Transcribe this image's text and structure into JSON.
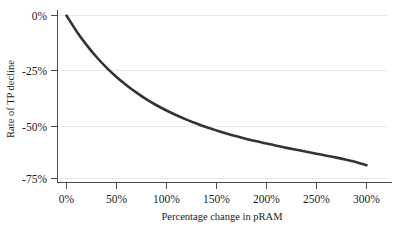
{
  "chart_data": {
    "type": "line",
    "title": "",
    "xlabel": "Percentage change in pRAM",
    "ylabel": "Rate of TP decline",
    "xlim": [
      0,
      300
    ],
    "ylim": [
      -75,
      0
    ],
    "grid": true,
    "legend": null,
    "x_tick_labels": [
      "0%",
      "50%",
      "100%",
      "150%",
      "200%",
      "250%",
      "300%"
    ],
    "x_ticks": [
      0,
      50,
      100,
      150,
      200,
      250,
      300
    ],
    "y_tick_labels": [
      "0%",
      "-25%",
      "-50%",
      "-75%"
    ],
    "y_ticks": [
      0,
      -25,
      -50,
      -75
    ],
    "series": [
      {
        "name": "Rate of TP decline",
        "color": "#333333",
        "x": [
          0,
          10,
          20,
          30,
          40,
          50,
          60,
          70,
          80,
          90,
          100,
          110,
          120,
          130,
          140,
          150,
          160,
          170,
          180,
          190,
          200,
          210,
          220,
          230,
          240,
          250,
          260,
          270,
          280,
          290,
          300
        ],
        "values": [
          0,
          -7.2,
          -13.5,
          -19.1,
          -24.0,
          -28.3,
          -32.1,
          -35.5,
          -38.6,
          -41.3,
          -43.7,
          -45.9,
          -47.9,
          -49.7,
          -51.4,
          -52.9,
          -54.3,
          -55.6,
          -56.8,
          -57.9,
          -58.9,
          -59.9,
          -60.9,
          -61.8,
          -62.7,
          -63.6,
          -64.5,
          -65.4,
          -66.4,
          -67.5,
          -68.9
        ]
      }
    ]
  },
  "figure": {
    "background_color": "#ffffff",
    "gridline_color": "#e9e9e9",
    "axis_color": "#4a4a4a",
    "curve_color": "#333333"
  }
}
